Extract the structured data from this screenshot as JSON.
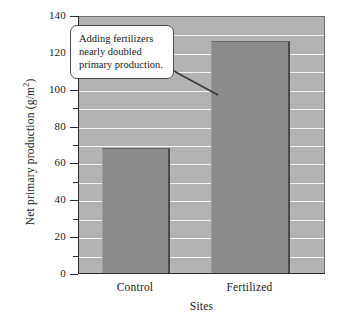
{
  "chart_data": {
    "type": "bar",
    "title": "",
    "subtitle": "",
    "xlabel": "Sites",
    "ylabel": "Net primary production (g/m",
    "ylabel_superscript": "2",
    "ylabel_suffix": ")",
    "categories": [
      "Control",
      "Fertilized"
    ],
    "values": [
      68,
      126
    ],
    "series": [
      {
        "name": "Net primary production",
        "values": [
          68,
          126
        ]
      }
    ],
    "ylim": [
      0,
      140
    ],
    "y_major_ticks": [
      0,
      20,
      40,
      60,
      80,
      100,
      120,
      140
    ],
    "y_minor_ticks": [
      10,
      30,
      50,
      70,
      90,
      110,
      130
    ],
    "y_tick_labels": [
      "0",
      "20",
      "40",
      "60",
      "80",
      "100",
      "120",
      "140"
    ],
    "gridlines": "horizontal",
    "grid_interval": 10,
    "legend": "none",
    "annotations": [
      {
        "text": "Adding fertilizers nearly doubled primary production.",
        "lines": [
          "Adding fertilizers",
          "nearly doubled",
          "primary production."
        ],
        "points_to": "Fertilized"
      }
    ],
    "colors": {
      "plot_background": "#b3b3b3",
      "bar_fill": "#8c8c8c",
      "gridline": "#f2f2f2",
      "axis": "#2b2b2b",
      "callout_border": "#4d4d4d",
      "callout_background": "#ffffff",
      "page_background": "#ffffff",
      "text": "#1a1a1a"
    }
  }
}
